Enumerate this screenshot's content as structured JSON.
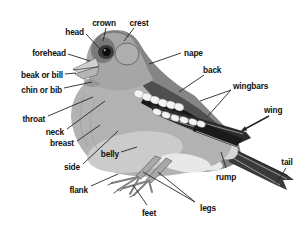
{
  "figure": {
    "name": "bird-anatomy-topography-diagram",
    "background": "#ffffff",
    "leader_line_color": "#262626",
    "label_text_color": "#111111",
    "palette": {
      "body_gray": "#b2b2b2",
      "belly_light": "#cbcbcb",
      "vent_white": "#e8e8e8",
      "mantle_gray": "#858585",
      "scapular_gray": "#4f4f4f",
      "head_gray": "#a6a6a6",
      "face_dark": "#6a6a6a",
      "eye_ring_dark": "#3a3a3a",
      "eye_black": "#0c0c0c",
      "ear_panel": "#aeaeae",
      "wing_dark": "#2c2c2c",
      "covert_black": "#161616",
      "tertial_black": "#1a1a1a",
      "wingbar_white": "#f4f4f4",
      "tail_dark": "#3a3a3a",
      "rump_light": "#d6d6d6",
      "undertail_light": "#e8e8e8",
      "beak_upper": "#d0d0d0",
      "beak_lower": "#b5b5b5",
      "leg_gray": "#a8a8a8",
      "toe_gray": "#7f7f7f"
    },
    "labels": [
      {
        "id": "head",
        "text": "head",
        "x": 84,
        "y": 35,
        "anchor": "end",
        "lines": [
          [
            [
              86,
              34
            ],
            [
              101,
              50
            ]
          ]
        ]
      },
      {
        "id": "crown",
        "text": "crown",
        "x": 104,
        "y": 26,
        "anchor": "middle",
        "lines": [
          [
            [
              106,
              28
            ],
            [
              103,
              41
            ]
          ]
        ]
      },
      {
        "id": "crest",
        "text": "crest",
        "x": 139,
        "y": 26,
        "anchor": "middle",
        "lines": [
          [
            [
              134,
              28
            ],
            [
              124,
              41
            ]
          ]
        ]
      },
      {
        "id": "forehead",
        "text": "forehead",
        "x": 66,
        "y": 56,
        "anchor": "end",
        "lines": [
          [
            [
              68,
              54
            ],
            [
              90,
              61
            ]
          ]
        ]
      },
      {
        "id": "nape",
        "text": "nape",
        "x": 184,
        "y": 56,
        "anchor": "start",
        "lines": [
          [
            [
              181,
              53
            ],
            [
              149,
              64
            ]
          ]
        ]
      },
      {
        "id": "beak-or-bill",
        "text": "beak or bill",
        "x": 63,
        "y": 78,
        "anchor": "end",
        "lines": [
          [
            [
              65,
              74
            ],
            [
              76,
              73
            ]
          ]
        ]
      },
      {
        "id": "back",
        "text": "back",
        "x": 203,
        "y": 73,
        "anchor": "start",
        "lines": [
          [
            [
              204,
              75
            ],
            [
              179,
              92
            ]
          ]
        ]
      },
      {
        "id": "chin-or-bib",
        "text": "chin or bib",
        "x": 62,
        "y": 93,
        "anchor": "end",
        "lines": [
          [
            [
              64,
              88
            ],
            [
              92,
              82
            ]
          ]
        ]
      },
      {
        "id": "wingbars",
        "text": "wingbars",
        "x": 233,
        "y": 89,
        "anchor": "start",
        "lines": [
          [
            [
              231,
              90
            ],
            [
              200,
              101
            ]
          ],
          [
            [
              231,
              90
            ],
            [
              207,
              117
            ]
          ]
        ]
      },
      {
        "id": "throat",
        "text": "throat",
        "x": 45,
        "y": 122,
        "anchor": "end",
        "lines": [
          [
            [
              48,
              116
            ],
            [
              93,
              97
            ]
          ]
        ]
      },
      {
        "id": "wing",
        "text": "wing",
        "x": 264,
        "y": 113,
        "anchor": "start",
        "arrow": true,
        "line_width": 1.5,
        "lines": [
          [
            [
              269,
              116
            ],
            [
              243,
              130
            ]
          ]
        ]
      },
      {
        "id": "neck",
        "text": "neck",
        "x": 64,
        "y": 135,
        "anchor": "end",
        "lines": [
          [
            [
              67,
              129
            ],
            [
              105,
              101
            ]
          ]
        ]
      },
      {
        "id": "breast",
        "text": "breast",
        "x": 74,
        "y": 146,
        "anchor": "end",
        "lines": [
          [
            [
              77,
              141
            ],
            [
              100,
              125
            ]
          ]
        ]
      },
      {
        "id": "belly",
        "text": "belly",
        "x": 119,
        "y": 157,
        "anchor": "end",
        "lines": [
          [
            [
              121,
              152
            ],
            [
              137,
              147
            ]
          ]
        ]
      },
      {
        "id": "side",
        "text": "side",
        "x": 80,
        "y": 170,
        "anchor": "end",
        "lines": [
          [
            [
              83,
              164
            ],
            [
              118,
              131
            ]
          ]
        ]
      },
      {
        "id": "tail",
        "text": "tail",
        "x": 287,
        "y": 165,
        "anchor": "middle",
        "lines": [
          [
            [
              286,
              168
            ],
            [
              276,
              184
            ]
          ]
        ]
      },
      {
        "id": "rump",
        "text": "rump",
        "x": 226,
        "y": 180,
        "anchor": "middle",
        "lines": [
          [
            [
              226,
              168
            ],
            [
              221,
              152
            ]
          ]
        ]
      },
      {
        "id": "flank",
        "text": "flank",
        "x": 88,
        "y": 193,
        "anchor": "end",
        "lines": [
          [
            [
              91,
              186
            ],
            [
              118,
              174
            ]
          ]
        ]
      },
      {
        "id": "feet",
        "text": "feet",
        "x": 149,
        "y": 216,
        "anchor": "middle",
        "lines": [
          [
            [
              147,
              205
            ],
            [
              133,
              185
            ]
          ]
        ]
      },
      {
        "id": "legs",
        "text": "legs",
        "x": 208,
        "y": 211,
        "anchor": "middle",
        "lines": [
          [
            [
              195,
              202
            ],
            [
              143,
              172
            ]
          ],
          [
            [
              195,
              202
            ],
            [
              158,
              172
            ]
          ]
        ]
      }
    ]
  }
}
